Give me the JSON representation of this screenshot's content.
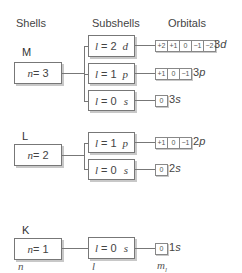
{
  "headers": {
    "shells": "Shells",
    "subshells": "Subshells",
    "orbitals": "Orbitals"
  },
  "shells": [
    {
      "letter": "M",
      "n_label": "n",
      "n_eq": " = 3",
      "subshells": [
        {
          "l_label": "l",
          "l_eq": " = 2",
          "type": "d",
          "orbitals": [
            "+2",
            "+1",
            "0",
            "−1",
            "−2"
          ],
          "orbital_num": "3",
          "orbital_type": "d"
        },
        {
          "l_label": "l",
          "l_eq": " = 1",
          "type": "p",
          "orbitals": [
            "+1",
            "0",
            "−1"
          ],
          "orbital_num": "3",
          "orbital_type": "p"
        },
        {
          "l_label": "l",
          "l_eq": " = 0",
          "type": "s",
          "orbitals": [
            "0"
          ],
          "orbital_num": "3",
          "orbital_type": "s"
        }
      ]
    },
    {
      "letter": "L",
      "n_label": "n",
      "n_eq": " = 2",
      "subshells": [
        {
          "l_label": "l",
          "l_eq": " = 1",
          "type": "p",
          "orbitals": [
            "+1",
            "0",
            "−1"
          ],
          "orbital_num": "2",
          "orbital_type": "p"
        },
        {
          "l_label": "l",
          "l_eq": " = 0",
          "type": "s",
          "orbitals": [
            "0"
          ],
          "orbital_num": "2",
          "orbital_type": "s"
        }
      ]
    },
    {
      "letter": "K",
      "n_label": "n",
      "n_eq": " = 1",
      "subshells": [
        {
          "l_label": "l",
          "l_eq": " = 0",
          "type": "s",
          "orbitals": [
            "0"
          ],
          "orbital_num": "1",
          "orbital_type": "s"
        }
      ]
    }
  ],
  "axis_labels": {
    "n": "n",
    "l": "l",
    "m": "m",
    "m_sub": "l"
  }
}
